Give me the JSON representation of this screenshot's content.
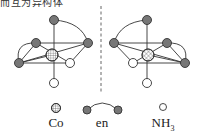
{
  "header": {
    "cut_text": "而互为异构体"
  },
  "diagram": {
    "left_isomer": {
      "name": "isomer-left"
    },
    "right_isomer": {
      "name": "isomer-right"
    },
    "mirror_line": "dashed"
  },
  "legend": {
    "co_label": "Co",
    "en_label": "en",
    "nh3_label_main": "NH",
    "nh3_label_sub": "3"
  },
  "colors": {
    "ligand_en_fill": "#777777",
    "nh3_fill": "#ffffff",
    "stroke": "#333333"
  }
}
